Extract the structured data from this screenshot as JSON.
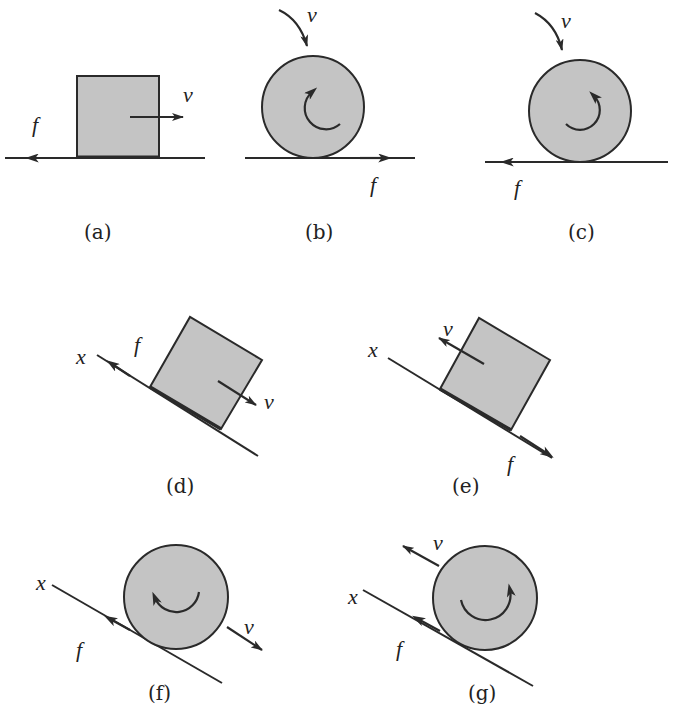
{
  "figure": {
    "panels": [
      {
        "id": "a",
        "caption": "(a)",
        "object": "block",
        "surface": "horizontal",
        "labels": {
          "v": "v",
          "f": "f"
        },
        "v_direction": "right",
        "f_direction": "left"
      },
      {
        "id": "b",
        "caption": "(b)",
        "object": "wheel",
        "surface": "horizontal",
        "labels": {
          "v": "v",
          "f": "f"
        },
        "rotation": "counterclockwise",
        "f_direction": "right"
      },
      {
        "id": "c",
        "caption": "(c)",
        "object": "wheel",
        "surface": "horizontal",
        "labels": {
          "v": "v",
          "f": "f"
        },
        "rotation": "clockwise",
        "f_direction": "left"
      },
      {
        "id": "d",
        "caption": "(d)",
        "object": "block",
        "surface": "incline",
        "labels": {
          "x": "x",
          "f": "f",
          "v": "v"
        },
        "v_direction": "down-slope",
        "f_direction": "up-slope"
      },
      {
        "id": "e",
        "caption": "(e)",
        "object": "block",
        "surface": "incline",
        "labels": {
          "x": "x",
          "v": "v",
          "f": "f"
        },
        "v_direction": "up-slope",
        "f_direction": "down-slope"
      },
      {
        "id": "f",
        "caption": "(f)",
        "object": "wheel",
        "surface": "incline",
        "labels": {
          "x": "x",
          "f": "f",
          "v": "v"
        },
        "rotation": "counterclockwise",
        "v_direction": "down-slope",
        "f_direction": "up-slope"
      },
      {
        "id": "g",
        "caption": "(g)",
        "object": "wheel",
        "surface": "incline",
        "labels": {
          "x": "x",
          "f": "f",
          "v": "v"
        },
        "rotation": "clockwise",
        "v_direction": "up-slope",
        "f_direction": "up-slope"
      }
    ]
  },
  "colors": {
    "fill": "#c4c4c4",
    "stroke": "#2a2a2a",
    "background": "#ffffff"
  }
}
